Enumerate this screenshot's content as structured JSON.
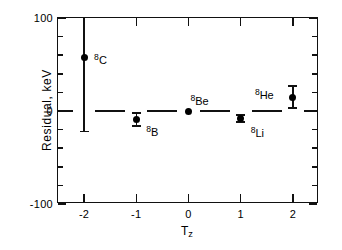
{
  "chart_data": {
    "type": "scatter",
    "title": "",
    "xlabel": "Tz",
    "ylabel": "Residual,  keV",
    "xlim": [
      -2.5,
      2.5
    ],
    "ylim": [
      -100,
      100
    ],
    "grid": false,
    "legend": null,
    "y_major_ticks": [
      100,
      0,
      -100
    ],
    "y_major_tick_labels": [
      "100",
      "0",
      "-100"
    ],
    "y_minor_tick_step": 20,
    "x_major_ticks": [
      -2,
      -1,
      0,
      1,
      2
    ],
    "x_major_tick_labels": [
      "-2",
      "-1",
      "0",
      "1",
      "2"
    ],
    "reference_line_y": 0,
    "points": [
      {
        "label_base": "C",
        "label_mass": "8",
        "x": -2,
        "y": 58,
        "err_up": 42,
        "err_down": 80,
        "label_dx": 10,
        "label_dy": -4
      },
      {
        "label_base": "B",
        "label_mass": "8",
        "x": -1,
        "y": -9,
        "err_up": 7,
        "err_down": 7,
        "label_dx": 10,
        "label_dy": 6
      },
      {
        "label_base": "Be",
        "label_mass": "8",
        "x": 0,
        "y": 0,
        "err_up": 0,
        "err_down": 0,
        "label_dx": 2,
        "label_dy": -17
      },
      {
        "label_base": "Li",
        "label_mass": "8",
        "x": 1,
        "y": -8,
        "err_up": 4,
        "err_down": 4,
        "label_dx": 10,
        "label_dy": 8
      },
      {
        "label_base": "He",
        "label_mass": "8",
        "x": 2,
        "y": 15,
        "err_up": 12,
        "err_down": 12,
        "label_dx": -38,
        "label_dy": -9
      }
    ]
  },
  "axes": {
    "y_title": "Residual,  keV",
    "x_title_base": "T",
    "x_title_sub": "z",
    "y_tick_labels": [
      "100",
      "0",
      "-100"
    ],
    "x_tick_labels": [
      "-2",
      "-1",
      "0",
      "1",
      "2"
    ]
  }
}
